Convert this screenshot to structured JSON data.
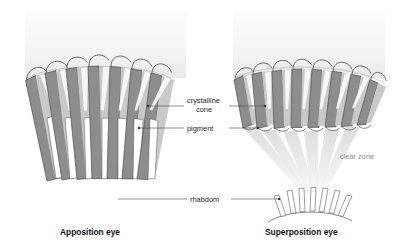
{
  "figure": {
    "kind": "scientific-diagram",
    "background_color": "#ffffff",
    "panel_fill_top": "#fbfbfb",
    "panel_fill_bottom": "#eceded",
    "pigment_color": "#8d8d8d",
    "cone_color": "#c9c9c9",
    "cone_highlight_color": "#ffffff",
    "outline_color": "#4f4f4f",
    "ray_color": "#e2e2e2",
    "rhabdom_fill": "#ffffff",
    "label_color": "#1b1b1b",
    "gray_label_color": "#8c8c8c"
  },
  "panels": [
    {
      "id": "apposition",
      "title": "Apposition eye",
      "title_x": 60,
      "title_y": 235,
      "ommatidia_count": 7,
      "has_clear_zone": false
    },
    {
      "id": "superposition",
      "title": "Superposition eye",
      "title_x": 265,
      "title_y": 235,
      "ommatidia_count": 7,
      "has_clear_zone": true,
      "rhabdom_rod_count": 7
    }
  ],
  "labels": [
    {
      "id": "crystalline-cone",
      "line1": "crystalline",
      "line2": "cone",
      "text_x": 187,
      "text_y": 103,
      "text_y2": 112,
      "anchor": "start"
    },
    {
      "id": "pigment",
      "line1": "pigment",
      "line2": "",
      "text_x": 187,
      "text_y": 131,
      "anchor": "start"
    },
    {
      "id": "rhabdom",
      "line1": "rhabdom",
      "line2": "",
      "text_x": 190,
      "text_y": 202,
      "anchor": "start"
    },
    {
      "id": "clear-zone",
      "line1": "clear zone",
      "line2": "",
      "text_x": 340,
      "text_y": 159,
      "anchor": "start"
    }
  ]
}
